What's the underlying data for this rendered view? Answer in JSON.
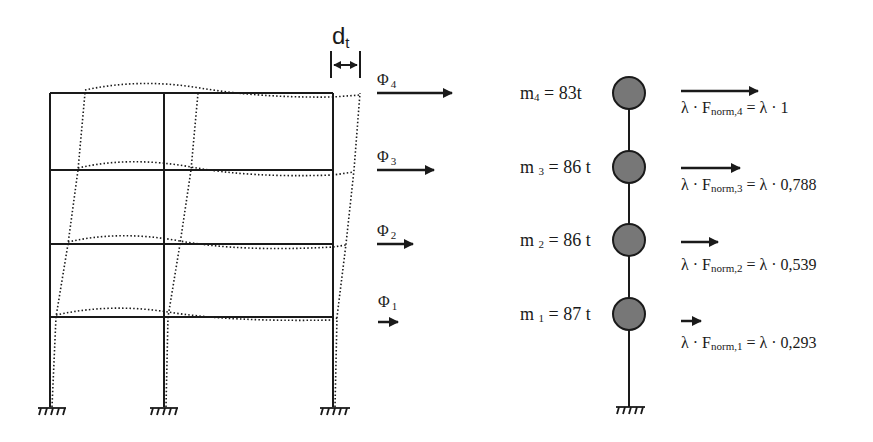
{
  "colors": {
    "line": "#1a1a1a",
    "mass_fill": "#777777",
    "background": "#ffffff"
  },
  "frame": {
    "displacement_label": "d",
    "displacement_sub": "t",
    "mode_labels": [
      {
        "sym": "Φ",
        "sub": "4"
      },
      {
        "sym": "Φ",
        "sub": "3"
      },
      {
        "sym": "Φ",
        "sub": "2"
      },
      {
        "sym": "Φ",
        "sub": "1"
      }
    ]
  },
  "stick": {
    "masses": [
      {
        "label": "m",
        "sub": "4",
        "value": " = 83t"
      },
      {
        "label": "m ",
        "sub": "3",
        "value": " = 86 t"
      },
      {
        "label": "m ",
        "sub": "2",
        "value": " = 86 t"
      },
      {
        "label": "m ",
        "sub": "1",
        "value": " = 87 t"
      }
    ],
    "forces": [
      {
        "prefix": "λ · F",
        "sub": "norm,4",
        "suffix": " = λ · 1"
      },
      {
        "prefix": "λ · F",
        "sub": "norm,3",
        "suffix": " = λ · 0,788"
      },
      {
        "prefix": "λ · F",
        "sub": "norm,2",
        "suffix": " = λ · 0,539"
      },
      {
        "prefix": "λ · F",
        "sub": "norm,1",
        "suffix": " = λ · 0,293"
      }
    ]
  }
}
